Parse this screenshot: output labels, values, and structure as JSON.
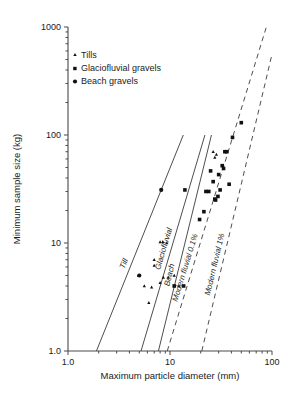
{
  "chart_data": {
    "type": "scatter",
    "title": "",
    "xlabel": "Maximum particle diameter (mm)",
    "ylabel": "Minimum sample size (kg)",
    "xscale": "log",
    "yscale": "log",
    "xlim": [
      1.0,
      100
    ],
    "ylim": [
      1.0,
      1000
    ],
    "grid": false,
    "xticks": [
      "1.0",
      "10",
      "100"
    ],
    "xtick_values": [
      1.0,
      10,
      100
    ],
    "yticks": [
      "1.0",
      "10",
      "100",
      "1000"
    ],
    "ytick_values": [
      1.0,
      10,
      100,
      1000
    ],
    "legend_position": "upper-left",
    "legend": [
      {
        "key": "tills",
        "label": "Tills",
        "marker": "small-dot"
      },
      {
        "key": "glaciofluvial",
        "label": "Glaciofluvial gravels",
        "marker": "medium-square"
      },
      {
        "key": "beach",
        "label": "Beach gravels",
        "marker": "large-dot"
      }
    ],
    "series": [
      {
        "name": "Tills",
        "marker": "small-dot",
        "points": [
          [
            4.9,
            5.0
          ],
          [
            5.6,
            4.0
          ],
          [
            6.6,
            3.9
          ],
          [
            6.2,
            2.8
          ],
          [
            7.0,
            7.0
          ],
          [
            7.0,
            6.2
          ],
          [
            8.0,
            10.2
          ],
          [
            8.5,
            10.3
          ],
          [
            9.3,
            10.0
          ],
          [
            8.6,
            4.8
          ],
          [
            9.6,
            4.8
          ],
          [
            8.0,
            4.3
          ],
          [
            11.0,
            5.0
          ],
          [
            12.2,
            4.0
          ],
          [
            26.5,
            70.0
          ],
          [
            27.5,
            62.0
          ],
          [
            28.5,
            66.0
          ]
        ]
      },
      {
        "name": "Glaciofluvial gravels",
        "marker": "medium-square",
        "points": [
          [
            11.0,
            4.0
          ],
          [
            13.6,
            4.0
          ],
          [
            14.0,
            31.0
          ],
          [
            19.5,
            16.5
          ],
          [
            21.5,
            19.5
          ],
          [
            22.5,
            30.0
          ],
          [
            24.0,
            30.0
          ],
          [
            25.0,
            46.5
          ],
          [
            26.5,
            37.0
          ],
          [
            27.5,
            25.5
          ],
          [
            28.0,
            25.0
          ],
          [
            29.5,
            27.0
          ],
          [
            30.0,
            43.0
          ],
          [
            31.0,
            31.0
          ],
          [
            32.5,
            52.0
          ],
          [
            33.5,
            49.0
          ],
          [
            34.5,
            70.0
          ],
          [
            36.0,
            70.0
          ],
          [
            38.0,
            35.0
          ],
          [
            41.0,
            95.0
          ],
          [
            50.0,
            130.0
          ]
        ]
      },
      {
        "name": "Beach gravels",
        "marker": "large-dot",
        "points": [
          [
            5.0,
            5.0
          ],
          [
            8.2,
            31.0
          ]
        ]
      }
    ],
    "trend_lines": [
      {
        "name": "Till",
        "label": "Till",
        "style": "solid",
        "p1": [
          1.9,
          1.0
        ],
        "p2": [
          13.5,
          100.0
        ]
      },
      {
        "name": "Glaciofluvial",
        "label": "Glaciofluvial",
        "style": "solid",
        "p1": [
          5.2,
          1.0
        ],
        "p2": [
          22.0,
          100.0
        ]
      },
      {
        "name": "Beach",
        "label": "Beach",
        "style": "solid",
        "p1": [
          7.7,
          1.0
        ],
        "p2": [
          25.5,
          100.0
        ]
      },
      {
        "name": "Modern fluvial 0.1%",
        "label": "Modern fluvial 0.1%",
        "style": "dashed",
        "p1": [
          9.4,
          1.0
        ],
        "p2": [
          88.0,
          1000.0
        ]
      },
      {
        "name": "Modern fluvial 1%",
        "label": "Modern fluvial 1%",
        "style": "dashed",
        "p1": [
          20.5,
          1.0
        ],
        "p2": [
          100.0,
          560.0
        ]
      }
    ]
  }
}
